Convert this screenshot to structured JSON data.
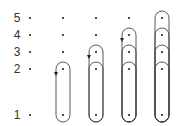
{
  "diagram": {
    "row_labels": [
      "5",
      "4",
      "3",
      "2",
      "1"
    ],
    "rows": [
      {
        "label": "5",
        "y": 18
      },
      {
        "label": "4",
        "y": 35
      },
      {
        "label": "3",
        "y": 52
      },
      {
        "label": "2",
        "y": 69
      },
      {
        "label": "1",
        "y": 115
      }
    ],
    "columns_x": [
      30,
      63,
      96,
      129,
      162
    ],
    "columns": [
      {
        "index": 1,
        "loops": [],
        "arrow_from": null
      },
      {
        "index": 2,
        "loops": [
          [
            "2",
            "1"
          ]
        ],
        "arrow_from": "2"
      },
      {
        "index": 3,
        "loops": [
          [
            "3",
            "1"
          ],
          [
            "2",
            "1"
          ]
        ],
        "arrow_from": "3"
      },
      {
        "index": 4,
        "loops": [
          [
            "4",
            "1"
          ],
          [
            "3",
            "1"
          ],
          [
            "2",
            "1"
          ]
        ],
        "arrow_from": "4"
      },
      {
        "index": 5,
        "loops": [
          [
            "5",
            "1"
          ],
          [
            "4",
            "1"
          ],
          [
            "3",
            "1"
          ],
          [
            "2",
            "1"
          ]
        ],
        "arrow_from": null
      }
    ],
    "colors": {
      "stroke": "#444444",
      "dot": "#222222",
      "label": "#333333"
    }
  }
}
